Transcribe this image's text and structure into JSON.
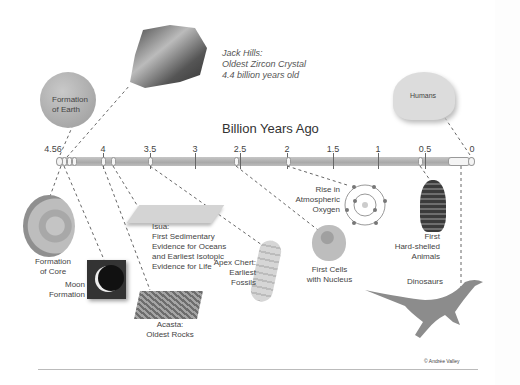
{
  "axis": {
    "title": "Billion Years Ago",
    "ticks": [
      "4.56",
      "4",
      "3.5",
      "3",
      "2.5",
      "2",
      "1.5",
      "1",
      "0.5",
      "0"
    ]
  },
  "events": {
    "formation_earth": "Formation of Earth",
    "jack_hills": [
      "Jack Hills:",
      "Oldest Zircon Crystal",
      "4.4 billion years old"
    ],
    "humans": "Humans",
    "formation_core": [
      "Formation",
      "of Core"
    ],
    "moon": [
      "Moon",
      "Formation"
    ],
    "acasta": [
      "Acasta:",
      "Oldest Rocks"
    ],
    "isua": [
      "Isua:",
      "First Sedimentary",
      "Evidence for Oceans",
      "and Earliest Isotopic",
      "Evidence for Life"
    ],
    "apex": [
      "Apex Chert:",
      "Earliest",
      "Fossils"
    ],
    "first_cells": [
      "First Cells",
      "with Nucleus"
    ],
    "oxygen": [
      "Rise in",
      "Atmospheric",
      "Oxygen"
    ],
    "hard_shelled": [
      "First",
      "Hard-shelled",
      "Animals"
    ],
    "dinosaurs": "Dinosaurs"
  },
  "credit": "© Andrée Valley",
  "colors": {
    "bar": "#b3b3b3",
    "text": "#444444",
    "background": "#ffffff"
  }
}
